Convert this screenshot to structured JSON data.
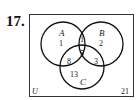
{
  "problem_number": "17.",
  "venn": {
    "universe_label": "U",
    "sets": [
      {
        "label": "A",
        "only": "1"
      },
      {
        "label": "B",
        "only": "2"
      },
      {
        "label": "C",
        "only": "13"
      }
    ],
    "regions": {
      "A_only": "1",
      "B_only": "2",
      "C_only": "13",
      "A_and_B_only": "1",
      "A_and_C_only": "8",
      "B_and_C_only": "3",
      "A_and_B_and_C": "5",
      "outside": "21"
    }
  }
}
